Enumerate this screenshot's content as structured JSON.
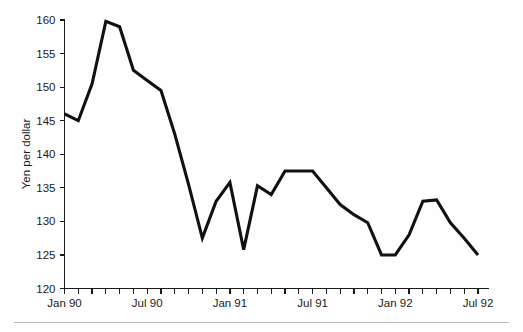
{
  "figure": {
    "background_color": "#fefefe",
    "line_color": "#111111",
    "axis_color": "#1a1a1a",
    "footer_rule_color": "#b8b8b8"
  },
  "chart_data": {
    "type": "line",
    "title": "",
    "subtitle": "",
    "xlabel": "",
    "ylabel": "Yen per dollar",
    "ylim": [
      120,
      160
    ],
    "yticks": [
      120,
      125,
      130,
      135,
      140,
      145,
      150,
      155,
      160
    ],
    "ytick_labels": [
      "120",
      "125",
      "130",
      "135",
      "140",
      "145",
      "150",
      "155",
      "160"
    ],
    "xlim": [
      "Jan 90",
      "Jul 92"
    ],
    "xtick_labels": [
      "Jan 90",
      "Jul 90",
      "Jan 91",
      "Jul 91",
      "Jan 92",
      "Jul 92"
    ],
    "xtick_label_indices": [
      0,
      6,
      12,
      18,
      24,
      30
    ],
    "minor_xticks_every": "1 month",
    "grid": false,
    "legend": null,
    "legend_position": "none",
    "x": [
      "Jan 90",
      "Feb 90",
      "Mar 90",
      "Apr 90",
      "May 90",
      "Jun 90",
      "Jul 90",
      "Aug 90",
      "Sep 90",
      "Oct 90",
      "Nov 90",
      "Dec 90",
      "Jan 91",
      "Feb 91",
      "Mar 91",
      "Apr 91",
      "May 91",
      "Jun 91",
      "Jul 91",
      "Aug 91",
      "Sep 91",
      "Oct 91",
      "Nov 91",
      "Dec 91",
      "Jan 92",
      "Feb 92",
      "Mar 92",
      "Apr 92",
      "May 92",
      "Jun 92",
      "Jul 92"
    ],
    "values": [
      146,
      145,
      150.5,
      159.8,
      159,
      152.5,
      151,
      149.5,
      143,
      135.5,
      127.5,
      133,
      135.8,
      125.8,
      135.3,
      134,
      137.5,
      137.5,
      137.5,
      135,
      132.5,
      131,
      129.8,
      125,
      125,
      128,
      133,
      133.2,
      129.8,
      127.5,
      125
    ]
  }
}
